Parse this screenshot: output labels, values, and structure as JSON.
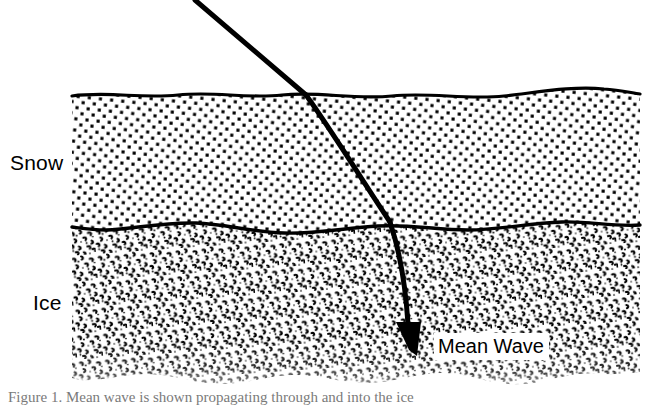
{
  "figure": {
    "width": 652,
    "height": 406,
    "background_color": "#ffffff",
    "ink_color": "#000000"
  },
  "labels": {
    "snow": "Snow",
    "ice": "Ice",
    "mean_wave": "Mean Wave"
  },
  "caption": {
    "text": "Figure 1.  Mean wave is shown propagating through and into the ice",
    "visible_fraction": "top edge only (clipped)"
  },
  "layers": [
    {
      "name": "snow",
      "label": "Snow",
      "fill_pattern": "square-dot-stipple",
      "top_y": 95,
      "bottom_y": 225,
      "left_x": 72,
      "right_x": 640
    },
    {
      "name": "ice",
      "label": "Ice",
      "fill_pattern": "comma-hook-stipple",
      "top_y": 225,
      "bottom_y": 383,
      "left_x": 72,
      "right_x": 640
    }
  ],
  "ray": {
    "name": "mean-wave-ray",
    "stroke_width": 5,
    "color": "#000000",
    "entry_point": [
      195,
      0
    ],
    "surface_refraction_point": [
      306,
      95
    ],
    "ice_refraction_point": [
      390,
      222
    ],
    "arrow_tip": [
      417,
      356
    ],
    "description": "Incident wave refracts steeper at the snow surface and again at the snow-ice interface, becoming near-vertical inside the ice."
  },
  "arrow": {
    "name": "mean-wave-arrowhead",
    "tip": [
      417,
      356
    ],
    "width": 22,
    "length": 34
  }
}
